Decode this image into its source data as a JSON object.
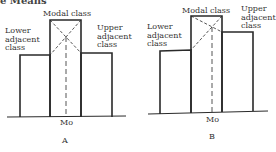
{
  "header": {
    "cut_text": "e Means"
  },
  "diagrams": [
    {
      "id": "A",
      "caption": "A",
      "modal_label": "Modal class",
      "lower_label": "Lower adjacent class",
      "lower_lines": [
        "Lower",
        "adjacent",
        "class"
      ],
      "upper_label": "Upper adjacent class",
      "upper_lines": [
        "Upper",
        "adjacent",
        "class"
      ],
      "mode_label": "Mo",
      "bars": [
        {
          "name": "lower adjacent class",
          "relative_height": 62
        },
        {
          "name": "modal class",
          "relative_height": 97
        },
        {
          "name": "upper adjacent class",
          "relative_height": 64
        }
      ]
    },
    {
      "id": "B",
      "caption": "B",
      "modal_label": "Modal class",
      "lower_label": "Lower adjacent class",
      "lower_lines": [
        "Lower",
        "adjacent",
        "class"
      ],
      "upper_label": "Upper adjacent class",
      "upper_lines": [
        "Upper",
        "adjacent",
        "class"
      ],
      "mode_label": "Mo",
      "bars": [
        {
          "name": "lower adjacent class",
          "relative_height": 62
        },
        {
          "name": "modal class",
          "relative_height": 97
        },
        {
          "name": "upper adjacent class",
          "relative_height": 81
        }
      ]
    }
  ]
}
